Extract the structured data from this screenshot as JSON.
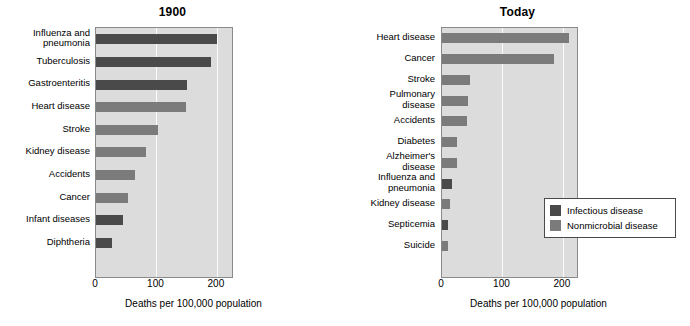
{
  "figure": {
    "xlabel": "Deaths per 100,000 population",
    "xticks": [
      "0",
      "100",
      "200"
    ],
    "xtick_values": [
      0,
      100,
      200
    ],
    "colors": {
      "infectious": "#4a4a4a",
      "nonmicrobial": "#7b7b7b",
      "plot_background": "#dcdcdc",
      "gridline": "#fbfbfb",
      "axis": "#8a8a8a",
      "page_background": "#ffffff"
    }
  },
  "legend": {
    "position": "bottom-right-of-today-panel",
    "items": [
      {
        "label": "Infectious disease",
        "swatch": "infectious"
      },
      {
        "label": "Nonmicrobial disease",
        "swatch": "nonmicrobial"
      }
    ]
  },
  "chart_data": [
    {
      "type": "bar",
      "orientation": "horizontal",
      "title": "1900",
      "xlabel": "Deaths per 100,000 population",
      "ylabel": "",
      "xlim": [
        0,
        225
      ],
      "xticks": [
        0,
        100,
        200
      ],
      "grid": true,
      "categories": [
        "Influenza and\npneumonia",
        "Tuberculosis",
        "Gastroenteritis",
        "Heart disease",
        "Stroke",
        "Kidney disease",
        "Accidents",
        "Cancer",
        "Infant diseases",
        "Diphtheria"
      ],
      "values": [
        200,
        191,
        151,
        149,
        102,
        82,
        64,
        53,
        45,
        26
      ],
      "groups": [
        "infectious",
        "infectious",
        "infectious",
        "nonmicrobial",
        "nonmicrobial",
        "nonmicrobial",
        "nonmicrobial",
        "nonmicrobial",
        "infectious",
        "infectious"
      ]
    },
    {
      "type": "bar",
      "orientation": "horizontal",
      "title": "Today",
      "xlabel": "Deaths per 100,000 population",
      "ylabel": "",
      "xlim": [
        0,
        225
      ],
      "xticks": [
        0,
        100,
        200
      ],
      "grid": true,
      "categories": [
        "Heart disease",
        "Cancer",
        "Stroke",
        "Pulmonary\ndisease",
        "Accidents",
        "Diabetes",
        "Alzheimer's\ndisease",
        "Influenza and\npneumonia",
        "Kidney disease",
        "Septicemia",
        "Suicide"
      ],
      "values": [
        210,
        186,
        47,
        43,
        42,
        25,
        24,
        17,
        14,
        10,
        10
      ],
      "groups": [
        "nonmicrobial",
        "nonmicrobial",
        "nonmicrobial",
        "nonmicrobial",
        "nonmicrobial",
        "nonmicrobial",
        "nonmicrobial",
        "infectious",
        "nonmicrobial",
        "infectious",
        "nonmicrobial"
      ]
    }
  ]
}
